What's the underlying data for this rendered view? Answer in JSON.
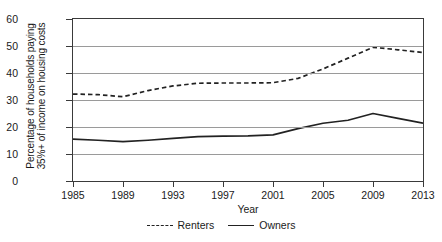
{
  "chart_data": {
    "type": "line",
    "title": "",
    "xlabel": "Year",
    "ylabel_lines": [
      "Percentage of households paying",
      "35%+ of income on housing costs"
    ],
    "xlim": [
      1985,
      2013
    ],
    "ylim": [
      0,
      60
    ],
    "ytick_values": [
      0,
      10,
      20,
      30,
      40,
      50,
      60
    ],
    "ytick_labels": [
      "0",
      "10",
      "20",
      "30",
      "40",
      "50",
      "60"
    ],
    "xtick_values": [
      1985,
      1989,
      1993,
      1997,
      2001,
      2005,
      2009,
      2013
    ],
    "xtick_labels": [
      "1985",
      "1989",
      "1993",
      "1997",
      "2001",
      "2005",
      "2009",
      "2013"
    ],
    "grid": true,
    "legend_position": "bottom-center",
    "x": [
      1985,
      1987,
      1989,
      1991,
      1993,
      1995,
      1997,
      1999,
      2001,
      2003,
      2005,
      2007,
      2009,
      2011,
      2013
    ],
    "series": [
      {
        "name": "Renters",
        "style": "dashed",
        "color": "#222222",
        "values": [
          32.2,
          32.0,
          31.2,
          33.5,
          35.2,
          36.2,
          36.3,
          36.3,
          36.4,
          38.0,
          41.5,
          45.5,
          49.5,
          48.6,
          47.6
        ]
      },
      {
        "name": "Owners",
        "style": "solid",
        "color": "#222222",
        "values": [
          15.5,
          15.1,
          14.6,
          15.1,
          15.8,
          16.4,
          16.6,
          16.7,
          17.1,
          19.4,
          21.4,
          22.5,
          25.0,
          23.2,
          21.4
        ]
      }
    ]
  },
  "legend": {
    "entries": [
      {
        "label": "Renters",
        "style": "dashed"
      },
      {
        "label": "Owners",
        "style": "solid"
      }
    ]
  }
}
